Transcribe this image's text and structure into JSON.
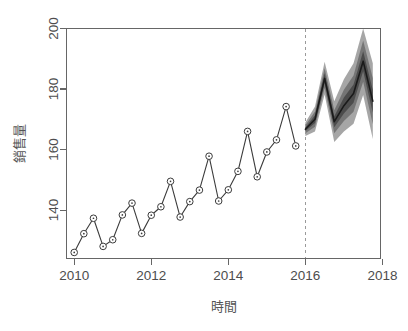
{
  "chart_data": {
    "type": "line",
    "title": "",
    "subtitle": "",
    "xlabel": "時間",
    "ylabel": "銷售量",
    "xlim": [
      2009.8,
      2017.95
    ],
    "ylim": [
      124,
      200
    ],
    "xticks": [
      2010,
      2012,
      2014,
      2016,
      2018
    ],
    "xticklabels": [
      "2010",
      "2012",
      "2014",
      "2016",
      "2018"
    ],
    "yticks": [
      140,
      160,
      180,
      200
    ],
    "yticklabels": [
      "140",
      "160",
      "180",
      "200"
    ],
    "grid": false,
    "legend": null,
    "annotations": [
      {
        "kind": "vertical-dashed-line",
        "x": 2016.0,
        "label": "forecast-origin"
      }
    ],
    "series": [
      {
        "name": "歷史銷售量",
        "kind": "observed",
        "marker": "open-circle-with-dot",
        "x": [
          2010.0,
          2010.25,
          2010.5,
          2010.75,
          2011.0,
          2011.25,
          2011.5,
          2011.75,
          2012.0,
          2012.25,
          2012.5,
          2012.75,
          2013.0,
          2013.25,
          2013.5,
          2013.75,
          2014.0,
          2014.25,
          2014.5,
          2014.75,
          2015.0,
          2015.25,
          2015.5,
          2015.75
        ],
        "values": [
          126.0,
          132.2,
          137.3,
          128.0,
          130.2,
          138.4,
          142.3,
          132.3,
          138.3,
          141.1,
          149.5,
          137.7,
          142.8,
          146.6,
          157.8,
          143.0,
          146.7,
          152.8,
          166.0,
          151.0,
          159.2,
          163.2,
          174.2,
          161.2
        ]
      },
      {
        "name": "預測銷售量",
        "kind": "forecast-mean",
        "x": [
          2016.0,
          2016.25,
          2016.5,
          2016.75,
          2017.0,
          2017.25,
          2017.5,
          2017.75
        ],
        "values": [
          166.7,
          170.0,
          183.5,
          169.2,
          174.5,
          178.5,
          189.2,
          176.0
        ]
      }
    ],
    "prediction_intervals": [
      {
        "level": 95,
        "shade": "#9a9a9a",
        "x": [
          2016.0,
          2016.25,
          2016.5,
          2016.75,
          2017.0,
          2017.25,
          2017.5,
          2017.75
        ],
        "lower": [
          164.5,
          166.0,
          178.2,
          162.5,
          166.0,
          168.5,
          178.0,
          163.5
        ],
        "upper": [
          168.9,
          174.2,
          189.0,
          176.0,
          183.2,
          188.5,
          200.0,
          188.5
        ]
      },
      {
        "level": 80,
        "shade": "#6e6e6e",
        "x": [
          2016.0,
          2016.25,
          2016.5,
          2016.75,
          2017.0,
          2017.25,
          2017.5,
          2017.75
        ],
        "lower": [
          165.4,
          167.5,
          180.3,
          165.4,
          169.4,
          172.5,
          182.4,
          168.4
        ],
        "upper": [
          168.0,
          172.6,
          186.9,
          173.0,
          179.8,
          184.5,
          196.0,
          183.6
        ]
      },
      {
        "level": 50,
        "shade": "#474747",
        "x": [
          2016.0,
          2016.25,
          2016.5,
          2016.75,
          2017.0,
          2017.25,
          2017.5,
          2017.75
        ],
        "lower": [
          166.1,
          168.8,
          181.9,
          167.4,
          171.9,
          175.5,
          185.9,
          172.2
        ],
        "upper": [
          167.3,
          171.3,
          185.2,
          171.0,
          177.2,
          181.5,
          192.5,
          179.8
        ]
      }
    ]
  },
  "axis": {
    "x_title": "時間",
    "y_title": "銷售量"
  }
}
